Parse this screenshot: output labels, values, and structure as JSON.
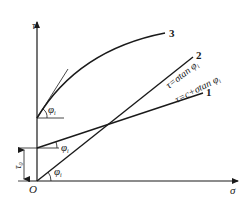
{
  "diagram": {
    "axes": {
      "y_label": "τ",
      "x_label": "σ",
      "origin_label": "O"
    },
    "curves": [
      {
        "id": "3",
        "label": "3",
        "kind": "curved envelope"
      },
      {
        "id": "2",
        "label": "2",
        "equation": "τ=σtan φ",
        "equation_subscript": "i"
      },
      {
        "id": "1",
        "label": "1",
        "equation": "τ=c+σtan φ",
        "equation_subscript": "i"
      }
    ],
    "angles": {
      "symbol": "φ",
      "subscript": "i"
    },
    "intercept": {
      "symbol": "τ",
      "subscript": "0"
    }
  }
}
